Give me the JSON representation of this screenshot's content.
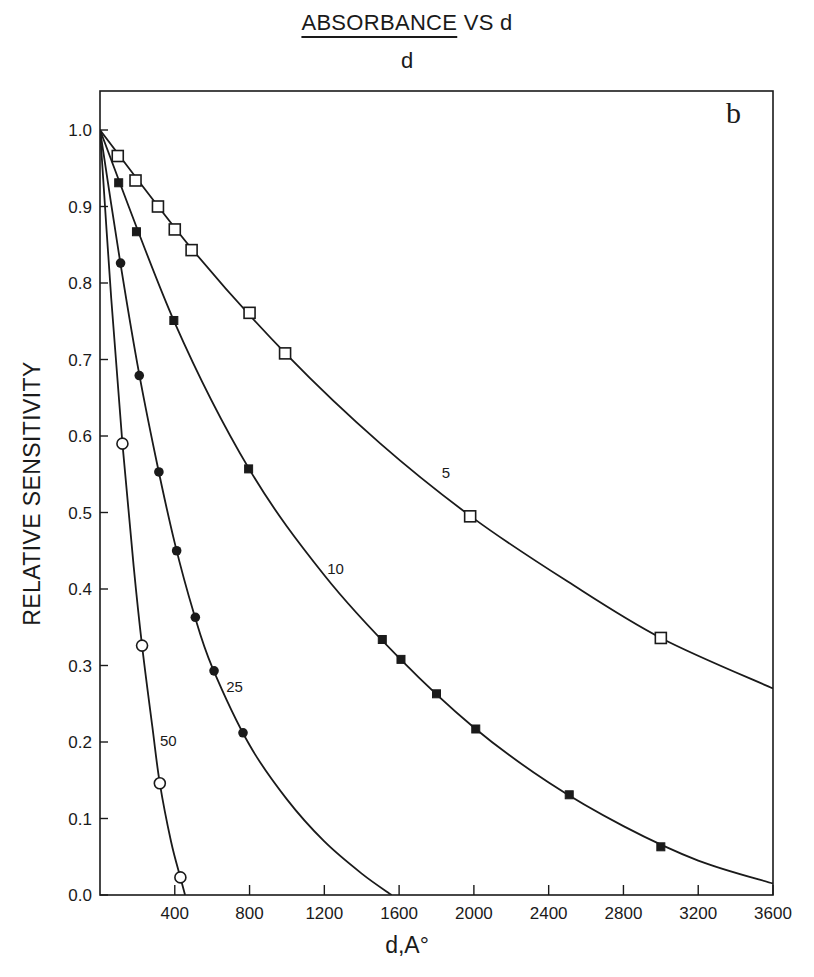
{
  "chart_data": {
    "type": "line",
    "title_numerator": "ABSORBANCE",
    "title_rest": " VS d",
    "title_denominator": "d",
    "panel_label": "b",
    "xlabel": "d,A°",
    "ylabel": "RELATIVE SENSITIVITY",
    "xlim": [
      0,
      3600
    ],
    "ylim": [
      0.0,
      1.05
    ],
    "grid": false,
    "x_ticks": [
      400,
      800,
      1200,
      1600,
      2000,
      2400,
      2800,
      3200,
      3600
    ],
    "x_tick_labels": [
      "400",
      "800",
      "1200",
      "1600",
      "2000",
      "2400",
      "2800",
      "3200",
      "3600"
    ],
    "y_ticks": [
      0.0,
      0.1,
      0.2,
      0.3,
      0.4,
      0.5,
      0.6,
      0.7,
      0.8,
      0.9,
      1.0
    ],
    "y_tick_labels": [
      "0.0",
      "0.1",
      "0.2",
      "0.3",
      "0.4",
      "0.5",
      "0.6",
      "0.7",
      "0.8",
      "0.9",
      "1.0"
    ],
    "series": [
      {
        "name": "5",
        "marker": "open-square",
        "label_pos": {
          "x": 1850,
          "y": 0.545
        },
        "points": [
          [
            0,
            1.0
          ],
          [
            95,
            0.966
          ],
          [
            190,
            0.934
          ],
          [
            310,
            0.9
          ],
          [
            400,
            0.87
          ],
          [
            490,
            0.843
          ],
          [
            800,
            0.761
          ],
          [
            990,
            0.708
          ],
          [
            1980,
            0.495
          ],
          [
            3000,
            0.336
          ]
        ],
        "curve": [
          [
            0,
            1.0
          ],
          [
            500,
            0.842
          ],
          [
            1000,
            0.706
          ],
          [
            1500,
            0.59
          ],
          [
            2000,
            0.492
          ],
          [
            2500,
            0.41
          ],
          [
            3000,
            0.336
          ],
          [
            3600,
            0.27
          ]
        ]
      },
      {
        "name": "10",
        "marker": "filled-square",
        "label_pos": {
          "x": 1260,
          "y": 0.42
        },
        "points": [
          [
            0,
            1.0
          ],
          [
            100,
            0.931
          ],
          [
            195,
            0.867
          ],
          [
            395,
            0.751
          ],
          [
            795,
            0.557
          ],
          [
            1510,
            0.334
          ],
          [
            1610,
            0.308
          ],
          [
            1800,
            0.263
          ],
          [
            2010,
            0.217
          ],
          [
            2510,
            0.131
          ],
          [
            3000,
            0.063
          ]
        ],
        "curve": [
          [
            0,
            1.0
          ],
          [
            400,
            0.748
          ],
          [
            800,
            0.556
          ],
          [
            1200,
            0.418
          ],
          [
            1600,
            0.31
          ],
          [
            2000,
            0.219
          ],
          [
            2400,
            0.147
          ],
          [
            2800,
            0.09
          ],
          [
            3200,
            0.045
          ],
          [
            3600,
            0.015
          ]
        ]
      },
      {
        "name": "25",
        "marker": "filled-circle",
        "label_pos": {
          "x": 720,
          "y": 0.265
        },
        "points": [
          [
            0,
            1.0
          ],
          [
            110,
            0.826
          ],
          [
            210,
            0.679
          ],
          [
            315,
            0.553
          ],
          [
            410,
            0.45
          ],
          [
            510,
            0.363
          ],
          [
            610,
            0.293
          ],
          [
            765,
            0.212
          ]
        ],
        "curve": [
          [
            0,
            1.0
          ],
          [
            100,
            0.84
          ],
          [
            200,
            0.694
          ],
          [
            300,
            0.57
          ],
          [
            400,
            0.46
          ],
          [
            500,
            0.37
          ],
          [
            600,
            0.298
          ],
          [
            800,
            0.196
          ],
          [
            1000,
            0.125
          ],
          [
            1200,
            0.07
          ],
          [
            1400,
            0.028
          ],
          [
            1560,
            0.0
          ]
        ]
      },
      {
        "name": "50",
        "marker": "open-circle",
        "label_pos": {
          "x": 365,
          "y": 0.195
        },
        "points": [
          [
            0,
            1.0
          ],
          [
            120,
            0.59
          ],
          [
            225,
            0.326
          ],
          [
            320,
            0.146
          ],
          [
            430,
            0.023
          ]
        ],
        "curve": [
          [
            0,
            1.0
          ],
          [
            60,
            0.78
          ],
          [
            120,
            0.59
          ],
          [
            180,
            0.43
          ],
          [
            225,
            0.326
          ],
          [
            280,
            0.22
          ],
          [
            320,
            0.146
          ],
          [
            380,
            0.07
          ],
          [
            430,
            0.023
          ],
          [
            455,
            0.0
          ]
        ]
      }
    ]
  },
  "colors": {
    "ink": "#1a1a1a",
    "background": "#ffffff"
  }
}
